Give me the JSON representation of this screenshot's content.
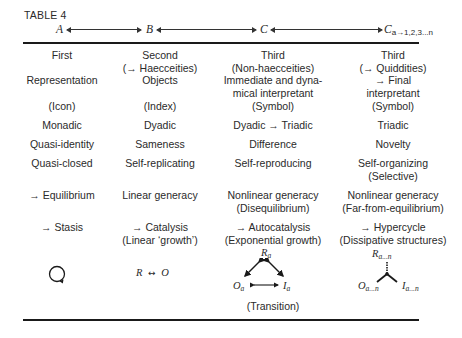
{
  "table": {
    "title": "TABLE 4",
    "header_labels": {
      "a": "A",
      "b": "B",
      "c": "C",
      "c_sub_base": "C",
      "c_sub": "a→1,2,3...n"
    },
    "columns": [
      {
        "rows": [
          [
            "First"
          ],
          [
            "Representation"
          ],
          [
            "(Icon)"
          ],
          [
            "Monadic"
          ],
          [
            "Quasi-identity"
          ],
          [
            "Quasi-closed"
          ],
          [
            "→ Equilibrium"
          ],
          [
            "→ Stasis"
          ]
        ]
      },
      {
        "rows": [
          [
            "Second",
            "(→ Haecceities)"
          ],
          [
            "Objects"
          ],
          [
            "(Index)"
          ],
          [
            "Dyadic"
          ],
          [
            "Sameness"
          ],
          [
            "Self-replicating"
          ],
          [
            "Linear generacy"
          ],
          [
            "→ Catalysis",
            "(Linear ‘growth’)"
          ]
        ]
      },
      {
        "rows": [
          [
            "Third",
            "(Non-haecceities)"
          ],
          [
            "Immediate and dyna-",
            "mical interpretant",
            "(Symbol)"
          ],
          [
            "Dyadic → Triadic"
          ],
          [
            "Difference"
          ],
          [
            "Self-reproducing"
          ],
          [
            "Nonlinear generacy",
            "(Disequilibrium)"
          ],
          [
            "→ Autocatalysis",
            "(Exponential growth)"
          ]
        ]
      },
      {
        "rows": [
          [
            "Third",
            "(→ Quiddities)"
          ],
          [
            "→ Final",
            "interpretant",
            "(Symbol)"
          ],
          [
            "Triadic"
          ],
          [
            "Novelty"
          ],
          [
            "Self-organizing",
            "(Selective)"
          ],
          [
            "Nonlinear generacy",
            "(Far-from-equilibrium)"
          ],
          [
            "→ Hypercycle",
            "(Dissipative structures)"
          ]
        ]
      }
    ],
    "diagrams": {
      "first": {
        "icon": "circular-loop-arrow-icon"
      },
      "second": {
        "left": "R",
        "arrow": "↔",
        "right": "O"
      },
      "third": {
        "top": "R",
        "top_sub": "a",
        "left": "O",
        "left_sub": "a",
        "right": "I",
        "right_sub": "a",
        "caption": "(Transition)"
      },
      "fourth": {
        "top": "R",
        "top_sub": "a...n",
        "left": "O",
        "left_sub": "a...n",
        "right": "I",
        "right_sub": "a...n"
      }
    }
  }
}
